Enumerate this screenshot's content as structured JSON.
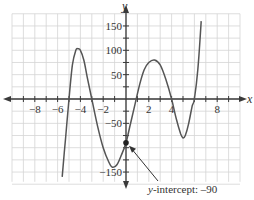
{
  "chart_data": {
    "type": "line",
    "title": "",
    "xlabel": "x",
    "ylabel": "y",
    "xlim": [
      -10,
      10
    ],
    "ylim": [
      -175,
      175
    ],
    "grid": true,
    "x_ticks": [
      -8,
      -6,
      -4,
      -2,
      2,
      4,
      8
    ],
    "x_tick_labels": [
      "−8",
      "−6",
      "−4",
      "−2",
      "2",
      "4",
      "8"
    ],
    "y_ticks": [
      150,
      100,
      50,
      -50,
      -150
    ],
    "y_tick_labels": [
      "150",
      "100",
      "50",
      "−50",
      "−150"
    ],
    "series": [
      {
        "name": "polynomial",
        "x": [
          -5.6,
          -5.3,
          -5.0,
          -4.7,
          -4.4,
          -4.2,
          -4.0,
          -3.7,
          -3.4,
          -3.0,
          -2.5,
          -2.0,
          -1.5,
          -1.2,
          -0.8,
          -0.4,
          0.0,
          0.4,
          0.8,
          1.2,
          1.6,
          2.0,
          2.5,
          3.0,
          3.5,
          4.0,
          4.4,
          4.8,
          5.0,
          5.2,
          5.5,
          5.8,
          6.0,
          6.3,
          6.6
        ],
        "values": [
          -160,
          -80,
          0,
          70,
          100,
          103,
          100,
          80,
          45,
          0,
          -55,
          -100,
          -130,
          -140,
          -135,
          -115,
          -90,
          -50,
          -10,
          30,
          60,
          75,
          80,
          70,
          40,
          0,
          -40,
          -72,
          -80,
          -75,
          -50,
          -15,
          0,
          60,
          160
        ]
      }
    ],
    "key_points": [
      {
        "label": "local max",
        "x": -4.2,
        "y": 103
      },
      {
        "label": "local min",
        "x": -1.2,
        "y": -140
      },
      {
        "label": "local max",
        "x": 2.5,
        "y": 80
      },
      {
        "label": "local min",
        "x": 5.0,
        "y": -80
      }
    ],
    "x_intercepts": [
      -5,
      -3,
      0.8,
      4,
      6
    ],
    "annotations": [
      {
        "text_italic": "y",
        "text": "-intercept: –90",
        "point": {
          "x": 0,
          "y": -90
        }
      }
    ]
  },
  "axes": {
    "x_label": "x",
    "y_label": "y"
  },
  "annotation": {
    "var": "y",
    "rest": "-intercept: –90"
  },
  "colors": {
    "curve": "#555555",
    "axis": "#3a3a3a",
    "grid": "#d4d4d4"
  }
}
